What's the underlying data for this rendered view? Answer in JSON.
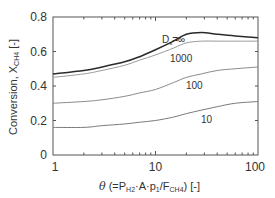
{
  "chart_data": {
    "type": "line",
    "title": "",
    "xlabel": "θ (=P_H2·A·p1/F_CH4) [-]",
    "ylabel": "Conversion, X_CH4 [-]",
    "xscale": "log",
    "xlim": [
      1,
      100
    ],
    "ylim": [
      0,
      0.8
    ],
    "grid": false,
    "legend": "inline labels",
    "x_ticks": [
      "1",
      "10",
      "100"
    ],
    "y_ticks": [
      "0",
      "0.2",
      "0.4",
      "0.6",
      "0.8"
    ],
    "x": [
      1,
      2,
      3,
      5,
      7,
      10,
      15,
      20,
      28,
      40,
      60,
      100
    ],
    "series": [
      {
        "name": "Ds=∞",
        "label": "Ds=∞",
        "color": "#2b2b2b",
        "values": [
          0.47,
          0.49,
          0.51,
          0.54,
          0.57,
          0.61,
          0.66,
          0.7,
          0.71,
          0.7,
          0.69,
          0.68
        ]
      },
      {
        "name": "1000",
        "label": "1000",
        "color": "#9a9a9a",
        "values": [
          0.45,
          0.47,
          0.49,
          0.52,
          0.55,
          0.58,
          0.62,
          0.65,
          0.66,
          0.66,
          0.66,
          0.66
        ]
      },
      {
        "name": "100",
        "label": "100",
        "color": "#8a8a8a",
        "values": [
          0.3,
          0.31,
          0.32,
          0.34,
          0.36,
          0.38,
          0.42,
          0.45,
          0.47,
          0.49,
          0.5,
          0.51
        ]
      },
      {
        "name": "10",
        "label": "10",
        "color": "#7a7a7a",
        "values": [
          0.16,
          0.16,
          0.17,
          0.18,
          0.19,
          0.2,
          0.22,
          0.24,
          0.26,
          0.28,
          0.3,
          0.31
        ]
      }
    ]
  },
  "labels": {
    "y_axis_main": "Conversion, X",
    "y_axis_sub": "CH4",
    "y_axis_unit": " [-]",
    "x_theta": "θ",
    "x_open": "  (=P",
    "x_h2": "H2",
    "x_mid1": "·A·p",
    "x_p1": "1",
    "x_mid2": "/F",
    "x_ch4": "CH4",
    "x_close": ") [-]",
    "curve_inf_D": "D",
    "curve_inf_s": "s",
    "curve_inf_eq": "=∞",
    "curve_1000": "1000",
    "curve_100": "100",
    "curve_10": "10",
    "ytick_0": "0",
    "ytick_02": "0.2",
    "ytick_04": "0.4",
    "ytick_06": "0.6",
    "ytick_08": "0.8",
    "xtick_1": "1",
    "xtick_10": "10",
    "xtick_100": "100"
  }
}
